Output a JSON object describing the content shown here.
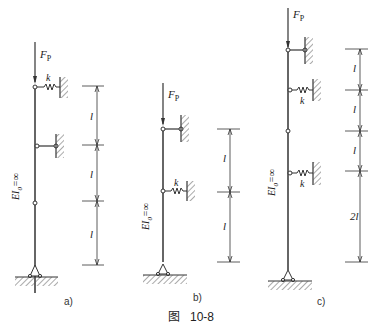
{
  "figure": {
    "title_prefix": "图",
    "title_number": "10-8",
    "panels": [
      {
        "id": "a",
        "caption": "a)",
        "load": "F",
        "load_sub": "P",
        "spring": "k",
        "stiffness": "EI",
        "stiffness_sub": "0",
        "stiffness_eq": "=∞",
        "dims": [
          "l",
          "l",
          "l"
        ]
      },
      {
        "id": "b",
        "caption": "b)",
        "load": "F",
        "load_sub": "P",
        "spring": "k",
        "stiffness": "EI",
        "stiffness_sub": "0",
        "stiffness_eq": "=∞",
        "dims": [
          "l",
          "l"
        ]
      },
      {
        "id": "c",
        "caption": "c)",
        "load": "F",
        "load_sub": "P",
        "spring": "k",
        "stiffness": "EI",
        "stiffness_sub": "0",
        "stiffness_eq": "=∞",
        "dims": [
          "l",
          "l",
          "l",
          "2l"
        ]
      }
    ]
  },
  "colors": {
    "line": "#333333",
    "hatch": "#555555",
    "background": "#ffffff"
  }
}
